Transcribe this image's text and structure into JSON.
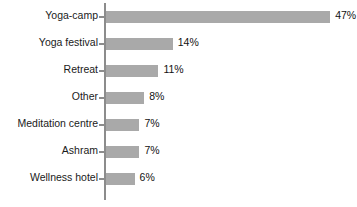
{
  "chart_data": {
    "type": "bar",
    "orientation": "horizontal",
    "title": "",
    "subtitle": "",
    "xlabel": "",
    "ylabel": "",
    "xlim": [
      0,
      50
    ],
    "grid": false,
    "legend": false,
    "bar_color": "#a9a9a9",
    "axis_color": "#8c8c8c",
    "text_color": "#111111",
    "categories": [
      "Yoga-camp",
      "Yoga festival",
      "Retreat",
      "Other",
      "Meditation centre",
      "Ashram",
      "Wellness hotel"
    ],
    "values": [
      47,
      14,
      11,
      8,
      7,
      7,
      6
    ],
    "value_labels": [
      "47%",
      "14%",
      "11%",
      "8%",
      "7%",
      "7%",
      "6%"
    ],
    "bars": [
      {
        "category": "Yoga-camp",
        "value": 47,
        "label": "47%"
      },
      {
        "category": "Yoga festival",
        "value": 14,
        "label": "14%"
      },
      {
        "category": "Retreat",
        "value": 11,
        "label": "11%"
      },
      {
        "category": "Other",
        "value": 8,
        "label": "8%"
      },
      {
        "category": "Meditation centre",
        "value": 7,
        "label": "7%"
      },
      {
        "category": "Ashram",
        "value": 7,
        "label": "7%"
      },
      {
        "category": "Wellness hotel",
        "value": 6,
        "label": "6%"
      }
    ]
  }
}
